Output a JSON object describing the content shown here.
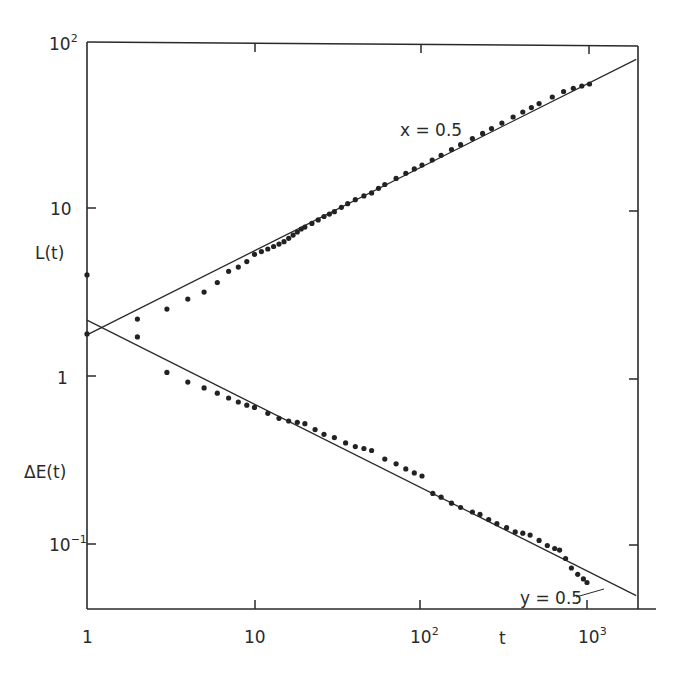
{
  "chart_data": {
    "type": "scatter",
    "title": "",
    "xlabel": "t",
    "ylabel_upper": "L(t)",
    "ylabel_lower": "ΔE(t)",
    "xscale": "log",
    "yscale": "log",
    "xlim": [
      1,
      1900
    ],
    "ylim": [
      0.041,
      100
    ],
    "grid": false,
    "legend": null,
    "x_ticks": [
      {
        "value": 1,
        "label": "1",
        "sup": ""
      },
      {
        "value": 10,
        "label": "10",
        "sup": ""
      },
      {
        "value": 100,
        "label": "10",
        "sup": "2"
      },
      {
        "value": 1000,
        "label": "10",
        "sup": "3"
      }
    ],
    "y_ticks": [
      {
        "value": 100,
        "label": "10",
        "sup": "2"
      },
      {
        "value": 10,
        "label": "10",
        "sup": ""
      },
      {
        "value": 1,
        "label": "1",
        "sup": ""
      },
      {
        "value": 0.1,
        "label": "10",
        "sup": "−1"
      }
    ],
    "series": [
      {
        "name": "L(t)",
        "marker": "dot",
        "x": [
          1,
          2,
          3,
          4,
          5,
          6,
          7,
          8,
          9,
          10,
          11,
          12,
          13,
          14,
          15,
          16,
          17,
          18,
          19,
          20,
          22,
          24,
          26,
          28,
          30,
          33,
          36,
          40,
          45,
          50,
          55,
          60,
          70,
          80,
          90,
          100,
          115,
          130,
          150,
          170,
          200,
          230,
          260,
          300,
          350,
          400,
          450,
          500,
          600,
          700,
          800,
          900,
          1000
        ],
        "values": [
          4.0,
          2.18,
          2.5,
          2.87,
          3.16,
          3.6,
          4.2,
          4.45,
          4.8,
          5.3,
          5.5,
          5.7,
          5.9,
          6.1,
          6.3,
          6.6,
          6.9,
          7.2,
          7.5,
          7.7,
          8.1,
          8.5,
          8.9,
          9.2,
          9.5,
          10.1,
          10.6,
          11.2,
          11.8,
          12.3,
          13.1,
          13.8,
          15.0,
          16.1,
          17.1,
          18.0,
          19.3,
          20.6,
          22.3,
          23.8,
          25.9,
          27.8,
          29.7,
          32.0,
          34.8,
          37.3,
          39.6,
          41.8,
          45.8,
          49.4,
          51.6,
          53.2,
          54.7
        ]
      },
      {
        "name": "ΔE(t)",
        "marker": "dot",
        "x": [
          1,
          2,
          3,
          4,
          5,
          6,
          7,
          8,
          9,
          10,
          12,
          14,
          16,
          18,
          20,
          23,
          26,
          30,
          35,
          40,
          45,
          50,
          60,
          70,
          80,
          90,
          100,
          116,
          130,
          150,
          170,
          200,
          222,
          250,
          280,
          320,
          360,
          400,
          442,
          500,
          560,
          620,
          663,
          720,
          780,
          850,
          920,
          966
        ],
        "values": [
          1.78,
          1.71,
          1.05,
          0.92,
          0.85,
          0.79,
          0.74,
          0.7,
          0.67,
          0.65,
          0.6,
          0.56,
          0.54,
          0.53,
          0.52,
          0.48,
          0.45,
          0.43,
          0.4,
          0.38,
          0.37,
          0.36,
          0.32,
          0.3,
          0.28,
          0.265,
          0.254,
          0.2,
          0.19,
          0.175,
          0.165,
          0.155,
          0.15,
          0.14,
          0.132,
          0.125,
          0.118,
          0.116,
          0.113,
          0.105,
          0.098,
          0.094,
          0.092,
          0.082,
          0.072,
          0.066,
          0.062,
          0.059
        ]
      }
    ],
    "fit_lines": [
      {
        "name": "x = 0.5",
        "form": "power",
        "coef": 1.76,
        "exponent": 0.5,
        "t_range": [
          1,
          1900
        ]
      },
      {
        "name": "y = 0.5",
        "form": "power",
        "coef": 2.15,
        "exponent": -0.5,
        "t_range": [
          1,
          1900
        ]
      }
    ],
    "annotations": [
      {
        "text": "x = 0.5",
        "near_series": "L(t)",
        "t": 140,
        "value": 33
      },
      {
        "text": "y = 0.5",
        "near_series": "ΔE(t)",
        "t": 700,
        "value": 0.045
      }
    ]
  },
  "labels": {
    "x_axis": "t",
    "y_upper": "L(t)",
    "y_lower": "ΔE(t)",
    "fit_upper": "x = 0.5",
    "fit_lower": "y = 0.5",
    "xt1": "1",
    "xt10": "10",
    "xt100": "10",
    "xt100_sup": "2",
    "xt1000": "10",
    "xt1000_sup": "3",
    "yt100": "10",
    "yt100_sup": "2",
    "yt10": "10",
    "yt1": "1",
    "yt01": "10",
    "yt01_sup": "−1"
  }
}
